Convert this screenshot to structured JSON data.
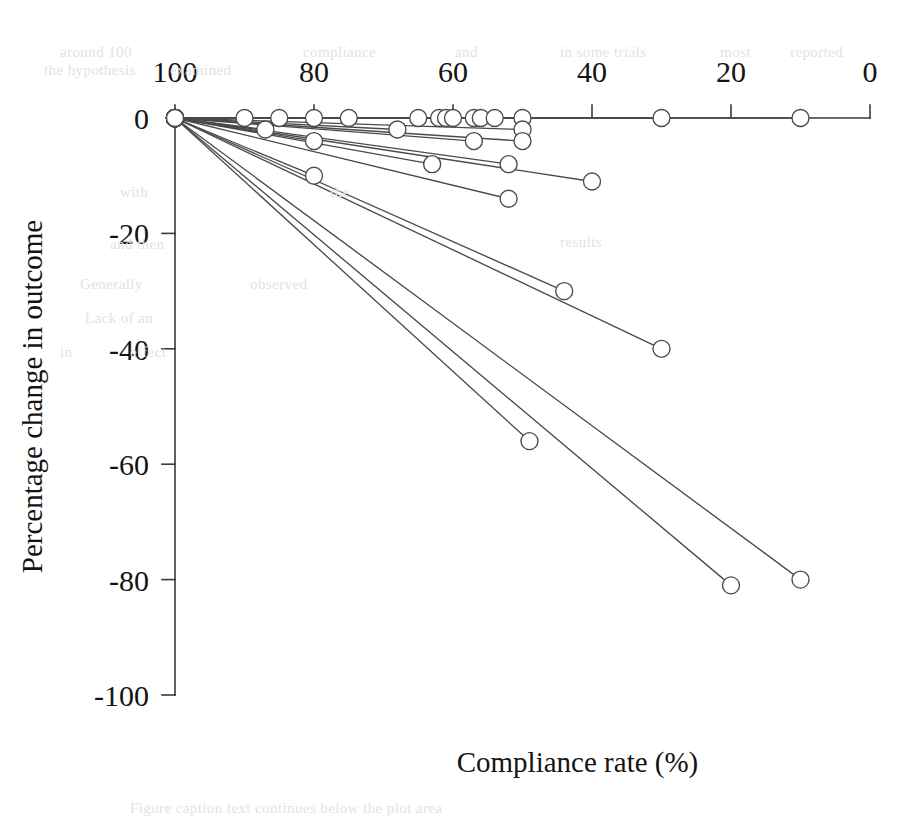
{
  "chart_data": {
    "type": "line",
    "title": "",
    "xlabel": "Compliance rate (%)",
    "ylabel": "Percentage change in outcome",
    "xlim": [
      100,
      0
    ],
    "ylim": [
      -100,
      0
    ],
    "x_reversed": true,
    "grid": false,
    "legend": "none",
    "xticks": [
      100,
      80,
      60,
      40,
      20,
      0
    ],
    "xtick_labels": [
      "100",
      "80",
      "60",
      "40",
      "20",
      "0"
    ],
    "yticks": [
      0,
      -20,
      -40,
      -60,
      -80,
      -100
    ],
    "ytick_labels": [
      "0",
      "-20",
      "-40",
      "-60",
      "-80",
      "-100"
    ],
    "marker": "open-circle",
    "line_color": "#4a4a4a",
    "marker_fill": "#ffffff",
    "note": "Each series is a two-point segment anchored at the common origin (100, 0); endpoint marker gives the study's compliance rate and percentage change in outcome.",
    "series": [
      {
        "name": "series-1",
        "x": [
          100,
          90
        ],
        "y": [
          0,
          0
        ]
      },
      {
        "name": "series-2",
        "x": [
          100,
          85
        ],
        "y": [
          0,
          0
        ]
      },
      {
        "name": "series-3",
        "x": [
          100,
          80
        ],
        "y": [
          0,
          0
        ]
      },
      {
        "name": "series-4",
        "x": [
          100,
          75
        ],
        "y": [
          0,
          0
        ]
      },
      {
        "name": "series-5",
        "x": [
          100,
          65
        ],
        "y": [
          0,
          0
        ]
      },
      {
        "name": "series-6",
        "x": [
          100,
          62
        ],
        "y": [
          0,
          0
        ]
      },
      {
        "name": "series-7",
        "x": [
          100,
          61
        ],
        "y": [
          0,
          0
        ]
      },
      {
        "name": "series-8",
        "x": [
          100,
          60
        ],
        "y": [
          0,
          0
        ]
      },
      {
        "name": "series-9",
        "x": [
          100,
          57
        ],
        "y": [
          0,
          0
        ]
      },
      {
        "name": "series-10",
        "x": [
          100,
          56
        ],
        "y": [
          0,
          0
        ]
      },
      {
        "name": "series-11",
        "x": [
          100,
          54
        ],
        "y": [
          0,
          0
        ]
      },
      {
        "name": "series-12",
        "x": [
          100,
          50
        ],
        "y": [
          0,
          0
        ]
      },
      {
        "name": "series-13",
        "x": [
          100,
          30
        ],
        "y": [
          0,
          0
        ]
      },
      {
        "name": "series-14",
        "x": [
          100,
          10
        ],
        "y": [
          0,
          0
        ]
      },
      {
        "name": "series-15",
        "x": [
          100,
          87
        ],
        "y": [
          0,
          -2
        ]
      },
      {
        "name": "series-16",
        "x": [
          100,
          68
        ],
        "y": [
          0,
          -2
        ]
      },
      {
        "name": "series-17",
        "x": [
          100,
          50
        ],
        "y": [
          0,
          -2
        ]
      },
      {
        "name": "series-18",
        "x": [
          100,
          80
        ],
        "y": [
          0,
          -4
        ]
      },
      {
        "name": "series-19",
        "x": [
          100,
          57
        ],
        "y": [
          0,
          -4
        ]
      },
      {
        "name": "series-20",
        "x": [
          100,
          50
        ],
        "y": [
          0,
          -4
        ]
      },
      {
        "name": "series-21",
        "x": [
          100,
          63
        ],
        "y": [
          0,
          -8
        ]
      },
      {
        "name": "series-22",
        "x": [
          100,
          52
        ],
        "y": [
          0,
          -8
        ]
      },
      {
        "name": "series-23",
        "x": [
          100,
          80
        ],
        "y": [
          0,
          -10
        ]
      },
      {
        "name": "series-24",
        "x": [
          100,
          40
        ],
        "y": [
          0,
          -11
        ]
      },
      {
        "name": "series-25",
        "x": [
          100,
          52
        ],
        "y": [
          0,
          -14
        ]
      },
      {
        "name": "series-26",
        "x": [
          100,
          44
        ],
        "y": [
          0,
          -30
        ]
      },
      {
        "name": "series-27",
        "x": [
          100,
          30
        ],
        "y": [
          0,
          -40
        ]
      },
      {
        "name": "series-28",
        "x": [
          100,
          49
        ],
        "y": [
          0,
          -56
        ]
      },
      {
        "name": "series-29",
        "x": [
          100,
          20
        ],
        "y": [
          0,
          -81
        ]
      },
      {
        "name": "series-30",
        "x": [
          100,
          10
        ],
        "y": [
          0,
          -80
        ]
      }
    ]
  },
  "page": {
    "background_color": "#ffffff",
    "ghost_text": [
      {
        "text": "around 100",
        "x": 60,
        "y": 44
      },
      {
        "text": "the hypothesis",
        "x": 44,
        "y": 62
      },
      {
        "text": "examined",
        "x": 170,
        "y": 62
      },
      {
        "text": "compliance",
        "x": 303,
        "y": 44
      },
      {
        "text": "and",
        "x": 455,
        "y": 44
      },
      {
        "text": "in some trials",
        "x": 560,
        "y": 44
      },
      {
        "text": "most",
        "x": 720,
        "y": 44
      },
      {
        "text": "reported",
        "x": 790,
        "y": 44
      },
      {
        "text": "with",
        "x": 120,
        "y": 184
      },
      {
        "text": "the",
        "x": 330,
        "y": 184
      },
      {
        "text": "results",
        "x": 560,
        "y": 234
      },
      {
        "text": "and then",
        "x": 110,
        "y": 236
      },
      {
        "text": "Generally",
        "x": 80,
        "y": 276
      },
      {
        "text": "observed",
        "x": 250,
        "y": 276
      },
      {
        "text": "Lack of an",
        "x": 85,
        "y": 310
      },
      {
        "text": "in",
        "x": 60,
        "y": 344
      },
      {
        "text": "effect",
        "x": 130,
        "y": 344
      },
      {
        "text": "Figure caption text continues below the plot area",
        "x": 130,
        "y": 800
      }
    ]
  }
}
